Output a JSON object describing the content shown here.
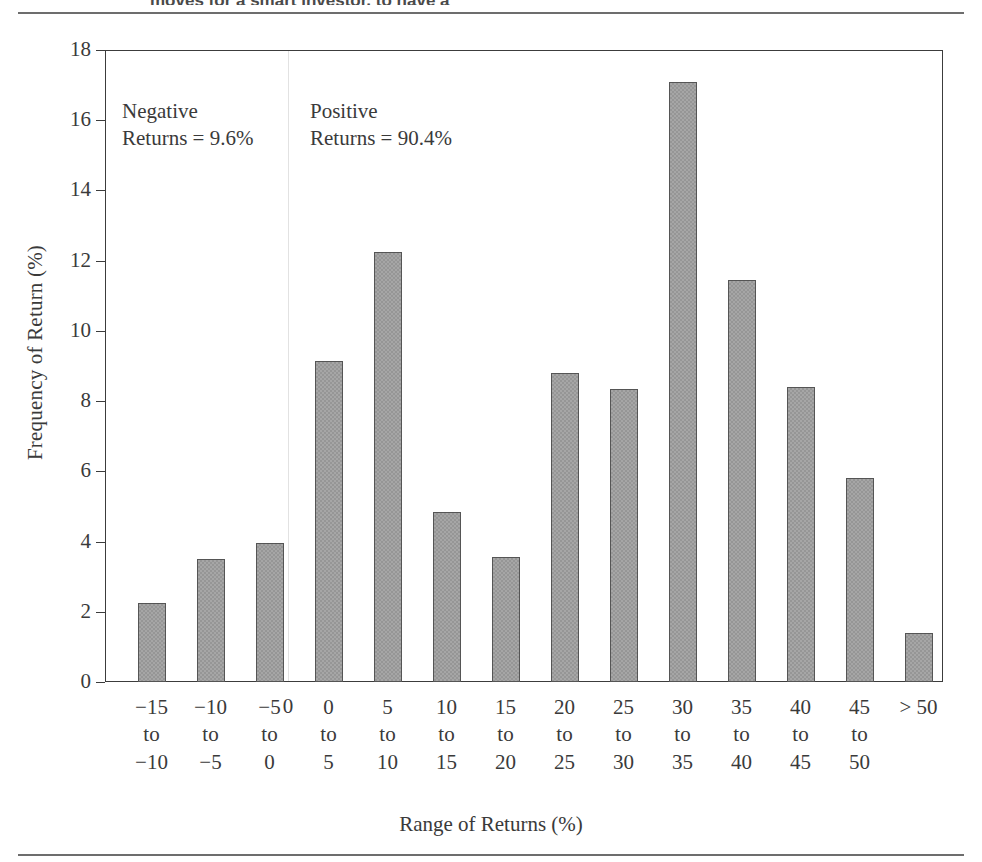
{
  "page": {
    "clipped_heading": "moves for a smart investor, to have a"
  },
  "chart_data": {
    "type": "bar",
    "title": "",
    "xlabel": "Range of Returns (%)",
    "ylabel": "Frequency of Return (%)",
    "ylim": [
      0,
      18
    ],
    "ytick_step": 2,
    "yticks": [
      "18",
      "16",
      "14",
      "12",
      "10",
      "8",
      "6",
      "4",
      "2",
      "0"
    ],
    "grid": false,
    "legend": "none",
    "bar_color": "#a6a6a6",
    "bar_edge_color": "#555555",
    "zero_divider_label": "0",
    "categories": [
      "−15\nto\n−10",
      "−10\nto\n−5",
      "−5\nto\n0",
      "0\nto\n5",
      "5\nto\n10",
      "10\nto\n15",
      "15\nto\n20",
      "20\nto\n25",
      "25\nto\n30",
      "30\nto\n35",
      "35\nto\n40",
      "40\nto\n45",
      "45\nto\n50",
      "> 50"
    ],
    "values": [
      2.25,
      3.5,
      3.95,
      9.15,
      12.25,
      4.85,
      3.55,
      8.8,
      8.35,
      17.1,
      11.45,
      8.4,
      5.8,
      1.4
    ],
    "annotations": [
      {
        "name": "negative-returns",
        "text": "Negative\nReturns = 9.6%"
      },
      {
        "name": "positive-returns",
        "text": "Positive\nReturns = 90.4%"
      }
    ]
  }
}
